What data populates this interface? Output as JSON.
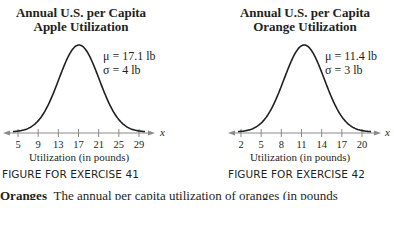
{
  "chart_data": [
    {
      "type": "line",
      "title": "Annual U.S. per Capita",
      "subtitle": "Apple Utilization",
      "xlabel": "Utilization (in pounds)",
      "axis_var": "x",
      "distribution": "normal",
      "mean": 17.1,
      "sd": 4,
      "xticks": [
        5,
        9,
        13,
        17,
        21,
        25,
        29
      ],
      "xlim": [
        2.5,
        32
      ],
      "annotations": [
        "μ = 17.1 lb",
        "σ = 4 lb"
      ],
      "caption": "FIGURE FOR EXERCISE 41",
      "grid": false
    },
    {
      "type": "line",
      "title": "Annual U.S. per Capita",
      "subtitle": "Orange Utilization",
      "xlabel": "Utilization (in pounds)",
      "axis_var": "x",
      "distribution": "normal",
      "mean": 11.4,
      "sd": 3,
      "xticks": [
        2,
        5,
        8,
        11,
        14,
        17,
        20
      ],
      "xlim": [
        0.2,
        23
      ],
      "annotations": [
        "μ = 11.4 lb",
        "σ = 3 lb"
      ],
      "caption": "FIGURE FOR EXERCISE 42",
      "grid": false
    }
  ],
  "body_text": {
    "lead": "Oranges",
    "rest": "The annual per capita utilization of oranges (in pounds"
  }
}
